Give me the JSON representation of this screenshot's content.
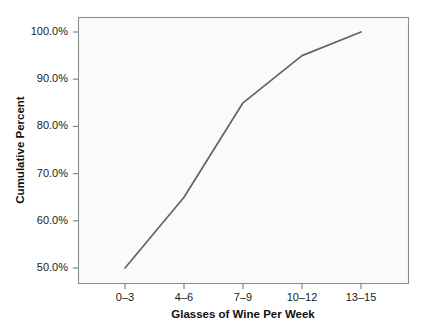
{
  "chart_data": {
    "type": "line",
    "title": "",
    "subtitle": "",
    "xlabel": "Glasses of Wine Per Week",
    "ylabel": "Cumulative Percent",
    "categories": [
      "0–3",
      "4–6",
      "7–9",
      "10–12",
      "13–15"
    ],
    "values": [
      50.0,
      65.0,
      85.0,
      95.0,
      100.0
    ],
    "series": [
      {
        "name": "Cumulative Percent",
        "values": [
          50.0,
          65.0,
          85.0,
          95.0,
          100.0
        ]
      }
    ],
    "ytick_labels": [
      "50.0%",
      "60.0%",
      "70.0%",
      "80.0%",
      "90.0%",
      "100.0%"
    ],
    "ytick_values": [
      50,
      60,
      70,
      80,
      90,
      100
    ],
    "ylim": [
      47.5,
      102.5
    ],
    "xtick_labels": [
      "0–3",
      "4–6",
      "7–9",
      "10–12",
      "13–15"
    ],
    "grid": false,
    "legend": false,
    "legend_position": "none",
    "line_color": "#6b6358",
    "frame_color": "#8d8d8d",
    "plot_background": "#fbfafb",
    "page_background": "#ffffff",
    "text_color": "#1a1a1a",
    "annotations": []
  }
}
